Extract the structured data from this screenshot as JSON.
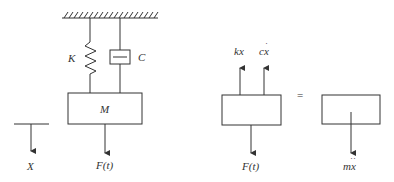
{
  "diagram": {
    "type": "spring-mass-damper free body diagram",
    "system": {
      "spring_label": "K",
      "damper_label": "C",
      "mass_label": "M",
      "force_label": "F(t)",
      "displacement_label": "X"
    },
    "free_body": {
      "spring_force_label": "kx",
      "damper_force_label": "cx",
      "damper_force_dot": "·",
      "applied_force_label": "F(t)",
      "equals_sign": "=",
      "inertia_label": "mx",
      "inertia_dots": "··"
    },
    "colors": {
      "line": "#333333",
      "background": "#ffffff"
    }
  }
}
